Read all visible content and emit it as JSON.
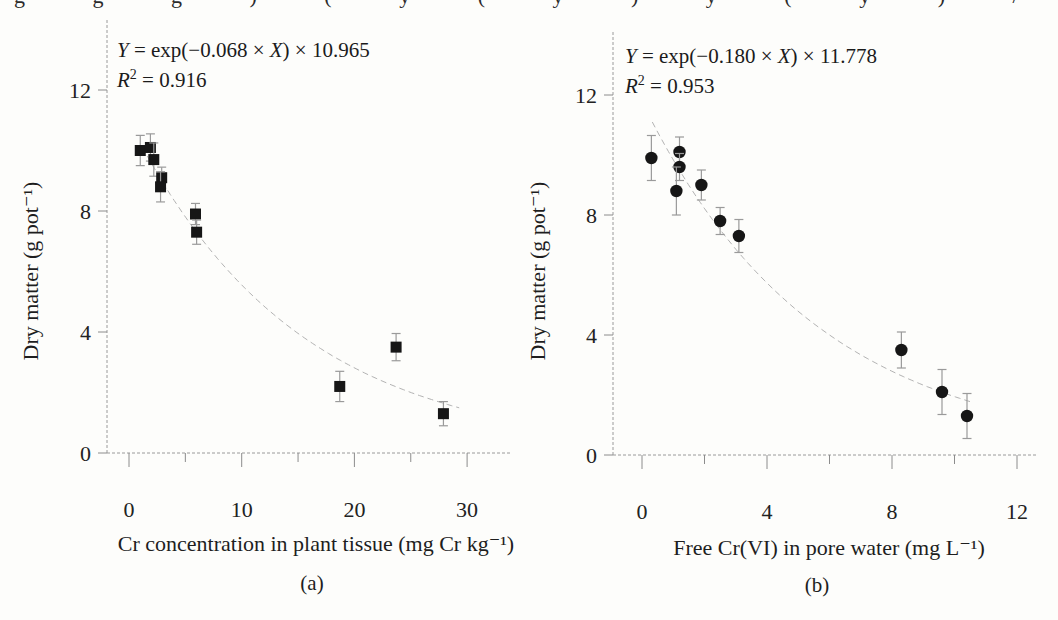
{
  "page": {
    "background": "#fdfdfb",
    "top_cropped_text": "g g g ) ( y ( y ) y ( y ) /"
  },
  "chart_data": [
    {
      "type": "scatter",
      "panel_label": "(a)",
      "marker": "square",
      "marker_color": "#161616",
      "xlabel": "Cr concentration in plant tissue (mg Cr kg⁻¹)",
      "ylabel": "Dry matter (g pot⁻¹)",
      "xlim": [
        0,
        33
      ],
      "ylim": [
        0,
        13.5
      ],
      "xticks": [
        0,
        10,
        20,
        30
      ],
      "xminorticks": [
        5,
        15,
        25
      ],
      "yticks": [
        0,
        4,
        8,
        12
      ],
      "grid": false,
      "equation": "Y = exp(−0.068 × X) × 10.965",
      "equation_parts": {
        "lhs": "Y",
        "mid": " = exp(−0.068 × ",
        "xvar": "X",
        "tail": ") × 10.965"
      },
      "r_squared": 0.916,
      "r2_parts": {
        "var": "R",
        "sup": "2",
        "rest": " = 0.916"
      },
      "fit": {
        "model": "Y = scale × exp(rate × X)",
        "scale": 10.965,
        "rate": -0.068,
        "x_start": 1.2,
        "x_end": 29.3
      },
      "points": [
        {
          "x": 1.0,
          "y": 10.0,
          "err": 0.5
        },
        {
          "x": 1.9,
          "y": 10.1,
          "err": 0.45
        },
        {
          "x": 2.2,
          "y": 9.7,
          "err": 0.55
        },
        {
          "x": 2.9,
          "y": 9.1,
          "err": 0.35
        },
        {
          "x": 2.8,
          "y": 8.8,
          "err": 0.5
        },
        {
          "x": 5.9,
          "y": 7.9,
          "err": 0.35
        },
        {
          "x": 6.0,
          "y": 7.3,
          "err": 0.4
        },
        {
          "x": 18.7,
          "y": 2.2,
          "err": 0.5
        },
        {
          "x": 23.7,
          "y": 3.5,
          "err": 0.45
        },
        {
          "x": 27.9,
          "y": 1.3,
          "err": 0.4
        }
      ]
    },
    {
      "type": "scatter",
      "panel_label": "(b)",
      "marker": "circle",
      "marker_color": "#161616",
      "xlabel": "Free Cr(VI) in pore water (mg L⁻¹)",
      "ylabel": "Dry matter (g pot⁻¹)",
      "xlim": [
        0,
        13
      ],
      "ylim": [
        0,
        13.5
      ],
      "xticks": [
        0,
        4,
        8,
        12
      ],
      "xminorticks": [
        2,
        6,
        10
      ],
      "yticks": [
        0,
        4,
        8,
        12
      ],
      "grid": false,
      "equation": "Y = exp(−0.180 × X) × 11.778",
      "equation_parts": {
        "lhs": "Y",
        "mid": " = exp(−0.180 × ",
        "xvar": "X",
        "tail": ") × 11.778"
      },
      "r_squared": 0.953,
      "r2_parts": {
        "var": "R",
        "sup": "2",
        "rest": " = 0.953"
      },
      "fit": {
        "model": "Y = scale × exp(rate × X)",
        "scale": 11.778,
        "rate": -0.18,
        "x_start": 0.33,
        "x_end": 10.55
      },
      "points": [
        {
          "x": 0.3,
          "y": 9.9,
          "err": 0.75
        },
        {
          "x": 1.2,
          "y": 10.1,
          "err": 0.5
        },
        {
          "x": 1.2,
          "y": 9.6,
          "err": 0.45
        },
        {
          "x": 1.1,
          "y": 8.8,
          "err": 0.8
        },
        {
          "x": 1.9,
          "y": 9.0,
          "err": 0.5
        },
        {
          "x": 2.5,
          "y": 7.8,
          "err": 0.45
        },
        {
          "x": 3.1,
          "y": 7.3,
          "err": 0.55
        },
        {
          "x": 8.3,
          "y": 3.5,
          "err": 0.6
        },
        {
          "x": 9.6,
          "y": 2.1,
          "err": 0.75
        },
        {
          "x": 10.4,
          "y": 1.3,
          "err": 0.75
        }
      ]
    }
  ]
}
